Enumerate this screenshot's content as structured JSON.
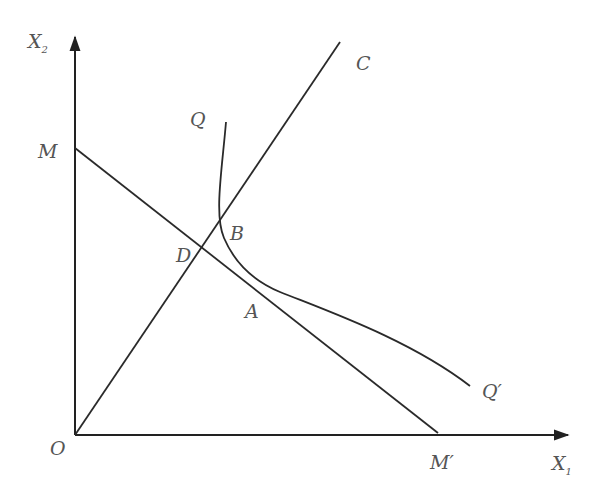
{
  "diagram": {
    "type": "isoquant-isocost",
    "colors": {
      "line": "#2a2a2a",
      "label": "#555555",
      "background": "#ffffff"
    },
    "axes": {
      "y": {
        "label": "X",
        "subscript": "2"
      },
      "x": {
        "label": "X",
        "subscript": "1"
      },
      "origin": {
        "label": "O"
      }
    },
    "points": {
      "M": {
        "label": "M"
      },
      "M_prime": {
        "label": "M′"
      },
      "C": {
        "label": "C"
      },
      "Q": {
        "label": "Q"
      },
      "Q_prime": {
        "label": "Q′"
      },
      "B": {
        "label": "B"
      },
      "D": {
        "label": "D"
      },
      "A": {
        "label": "A"
      }
    },
    "elements": [
      {
        "name": "isocost-line",
        "from": "M",
        "to": "M′"
      },
      {
        "name": "expansion-ray",
        "from": "O",
        "to": "C"
      },
      {
        "name": "isoquant-curve",
        "from": "Q",
        "to": "Q′",
        "tangent_at": "A"
      }
    ]
  }
}
